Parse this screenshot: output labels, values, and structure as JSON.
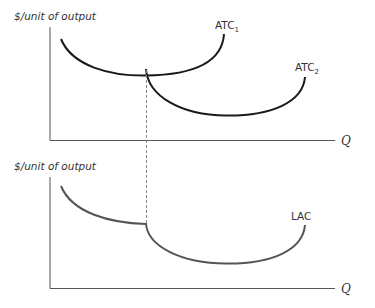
{
  "top_panel": {
    "y_axis_label": "$/unit of output",
    "x_axis_label": "Q",
    "curves": [
      {
        "name": "ATC",
        "subscript": "1",
        "color": "#1a1a1a"
      },
      {
        "name": "ATC",
        "subscript": "2",
        "color": "#1a1a1a"
      }
    ]
  },
  "bottom_panel": {
    "y_axis_label": "$/unit of output",
    "x_axis_label": "Q",
    "curves": [
      {
        "name": "LAC",
        "color": "#555555"
      }
    ]
  },
  "colors": {
    "axis": "#555555",
    "dashed_line": "#888888",
    "atc_curves": "#1a1a1a",
    "lac_curve": "#555555"
  }
}
